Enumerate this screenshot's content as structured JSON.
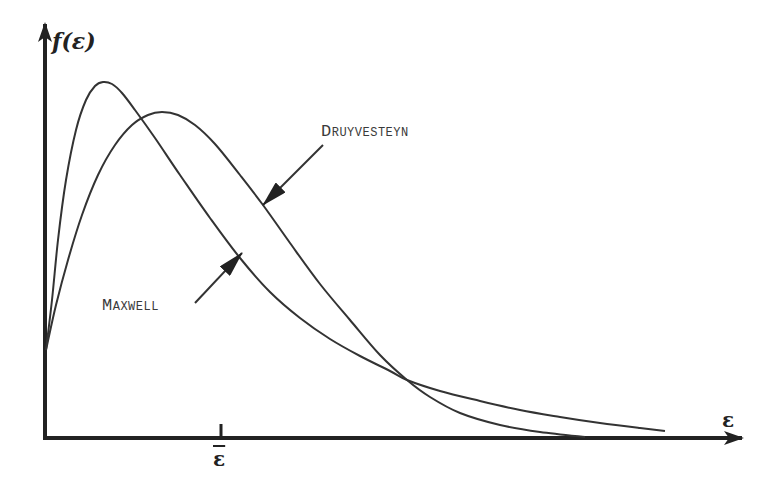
{
  "chart_data": {
    "type": "line",
    "title": "",
    "xlabel": "ε",
    "ylabel": "f(ε)",
    "xtick_label": "ε̄",
    "grid": false,
    "legend": "annotations with arrows",
    "series": [
      {
        "name": "Maxwell",
        "label": "Maxwell",
        "points_px": [
          [
            46,
            350
          ],
          [
            52,
            300
          ],
          [
            58,
            240
          ],
          [
            66,
            180
          ],
          [
            76,
            130
          ],
          [
            86,
            100
          ],
          [
            95,
            86
          ],
          [
            103,
            82
          ],
          [
            112,
            84
          ],
          [
            122,
            93
          ],
          [
            135,
            110
          ],
          [
            155,
            138
          ],
          [
            180,
            175
          ],
          [
            210,
            218
          ],
          [
            240,
            258
          ],
          [
            270,
            292
          ],
          [
            300,
            318
          ],
          [
            330,
            339
          ],
          [
            360,
            356
          ],
          [
            390,
            371
          ],
          [
            407,
            380
          ],
          [
            440,
            391
          ],
          [
            480,
            401
          ],
          [
            520,
            410
          ],
          [
            560,
            417
          ],
          [
            600,
            423
          ],
          [
            640,
            428
          ],
          [
            665,
            431
          ]
        ]
      },
      {
        "name": "Druyvesteyn",
        "label": "Druyvesteyn",
        "points_px": [
          [
            46,
            350
          ],
          [
            56,
            305
          ],
          [
            68,
            260
          ],
          [
            82,
            215
          ],
          [
            98,
            175
          ],
          [
            115,
            145
          ],
          [
            132,
            125
          ],
          [
            148,
            115
          ],
          [
            162,
            112
          ],
          [
            178,
            115
          ],
          [
            195,
            125
          ],
          [
            215,
            144
          ],
          [
            240,
            175
          ],
          [
            263,
            205
          ],
          [
            290,
            243
          ],
          [
            320,
            284
          ],
          [
            350,
            320
          ],
          [
            380,
            355
          ],
          [
            407,
            380
          ],
          [
            430,
            397
          ],
          [
            460,
            413
          ],
          [
            500,
            425
          ],
          [
            540,
            432
          ],
          [
            585,
            437
          ]
        ]
      }
    ],
    "annotations": [
      {
        "text": "Druyvesteyn",
        "arrow_from": [
          323,
          145
        ],
        "arrow_to": [
          263,
          205
        ]
      },
      {
        "text": "Maxwell",
        "arrow_from": [
          195,
          303
        ],
        "arrow_to": [
          242,
          253
        ]
      }
    ]
  },
  "labels": {
    "y_axis": "f(ε)",
    "x_axis": "ε",
    "x_tick": "ε",
    "druyvesteyn": "Druyvesteyn",
    "maxwell": "Maxwell"
  },
  "colors": {
    "axis": "#222222",
    "curve": "#333333",
    "text": "#3a3a3a"
  }
}
